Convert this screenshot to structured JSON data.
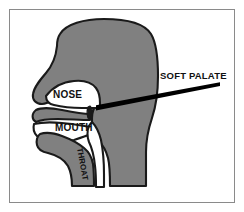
{
  "figure": {
    "background_color": "#ffffff",
    "frame_color": "#8a8a8a",
    "head_fill_color": "#808080",
    "cavity_fill_color": "#ffffff",
    "outline_color": "#1a1a1a",
    "pointer_color": "#000000"
  },
  "labels": {
    "nose": "NOSE",
    "mouth": "MOUTH",
    "throat": "THROAT",
    "soft_palate": "SOFT PALATE"
  },
  "annotations": {
    "pointer_start_x": 220,
    "pointer_start_y": 84,
    "pointer_end_x": 96,
    "pointer_end_y": 108
  }
}
